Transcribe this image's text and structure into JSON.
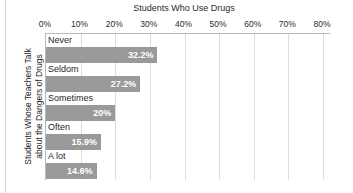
{
  "chart_data": {
    "type": "bar",
    "orientation": "horizontal",
    "title": "Students Who Use Drugs",
    "xlabel": "Students Who Use Drugs",
    "ylabel": "Students Whose Teachers Talk about the Dangers of Drugs",
    "ylabel_line1": "Students Whose Teachers Talk",
    "ylabel_line2": "about the Dangers of Drugs",
    "categories": [
      "Never",
      "Seldom",
      "Sometimes",
      "Often",
      "A lot"
    ],
    "values": [
      32.2,
      27.2,
      20,
      15.9,
      14.6
    ],
    "value_labels": [
      "32.2%",
      "27.2%",
      "20%",
      "15.9%",
      "14.6%"
    ],
    "xlim": [
      0,
      80
    ],
    "xtick_values": [
      0,
      10,
      20,
      30,
      40,
      50,
      60,
      70,
      80
    ],
    "xtick_labels": [
      "0%",
      "10%",
      "20%",
      "30%",
      "40%",
      "50%",
      "60%",
      "70%",
      "80%"
    ],
    "grid": true,
    "legend": null,
    "bar_color": "#999999",
    "value_label_color": "#ffffff",
    "gridline_color": "#dcdcdc",
    "axis_color": "#b9b9b9",
    "background": "#ffffff"
  }
}
